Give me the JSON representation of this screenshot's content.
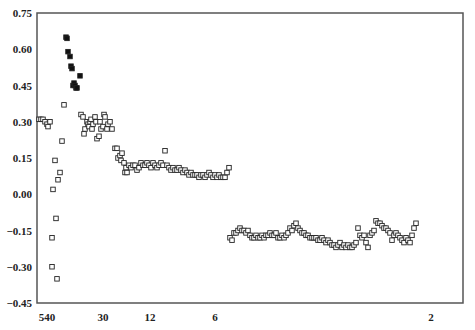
{
  "chart_data": {
    "type": "scatter",
    "title": "",
    "xlabel": "",
    "ylabel": "",
    "ylim": [
      -0.45,
      0.75
    ],
    "y_ticks": [
      "0.75",
      "0.60",
      "0.45",
      "0.30",
      "0.15",
      "0.00",
      "-0.15",
      "-0.30",
      "-0.45"
    ],
    "x_ticks": [
      {
        "label": "540",
        "px": 47
      },
      {
        "label": "30",
        "px": 103
      },
      {
        "label": "12",
        "px": 150
      },
      {
        "label": "6",
        "px": 215
      },
      {
        "label": "2",
        "px": 431
      }
    ],
    "grid": false,
    "legend": null,
    "series": [
      {
        "name": "filled",
        "marker": "filled-square",
        "points": [
          [
            66,
            0.65
          ],
          [
            67,
            0.645
          ],
          [
            68,
            0.59
          ],
          [
            70,
            0.57
          ],
          [
            71,
            0.53
          ],
          [
            72,
            0.52
          ],
          [
            73,
            0.45
          ],
          [
            74,
            0.46
          ],
          [
            75,
            0.45
          ],
          [
            76,
            0.44
          ],
          [
            77,
            0.44
          ],
          [
            80,
            0.49
          ]
        ]
      },
      {
        "name": "open",
        "marker": "open-square",
        "points": [
          [
            39,
            0.31
          ],
          [
            41,
            0.31
          ],
          [
            43,
            0.31
          ],
          [
            45,
            0.3
          ],
          [
            47,
            0.29
          ],
          [
            48,
            0.28
          ],
          [
            50,
            0.3
          ],
          [
            52,
            -0.18
          ],
          [
            52,
            -0.3
          ],
          [
            53,
            0.02
          ],
          [
            55,
            0.14
          ],
          [
            56,
            -0.1
          ],
          [
            57,
            -0.35
          ],
          [
            58,
            0.06
          ],
          [
            60,
            0.09
          ],
          [
            62,
            0.22
          ],
          [
            64,
            0.37
          ],
          [
            81,
            0.33
          ],
          [
            83,
            0.32
          ],
          [
            84,
            0.25
          ],
          [
            85,
            0.27
          ],
          [
            87,
            0.3
          ],
          [
            88,
            0.29
          ],
          [
            89,
            0.28
          ],
          [
            90,
            0.3
          ],
          [
            91,
            0.31
          ],
          [
            92,
            0.27
          ],
          [
            93,
            0.29
          ],
          [
            95,
            0.32
          ],
          [
            96,
            0.3
          ],
          [
            97,
            0.23
          ],
          [
            99,
            0.24
          ],
          [
            100,
            0.3
          ],
          [
            101,
            0.27
          ],
          [
            103,
            0.28
          ],
          [
            104,
            0.33
          ],
          [
            105,
            0.32
          ],
          [
            107,
            0.27
          ],
          [
            108,
            0.29
          ],
          [
            110,
            0.3
          ],
          [
            112,
            0.27
          ],
          [
            115,
            0.19
          ],
          [
            117,
            0.19
          ],
          [
            118,
            0.15
          ],
          [
            120,
            0.16
          ],
          [
            121,
            0.14
          ],
          [
            122,
            0.17
          ],
          [
            124,
            0.13
          ],
          [
            125,
            0.09
          ],
          [
            126,
            0.11
          ],
          [
            127,
            0.09
          ],
          [
            129,
            0.12
          ],
          [
            131,
            0.11
          ],
          [
            133,
            0.12
          ],
          [
            135,
            0.12
          ],
          [
            137,
            0.1
          ],
          [
            139,
            0.11
          ],
          [
            141,
            0.13
          ],
          [
            143,
            0.12
          ],
          [
            145,
            0.12
          ],
          [
            147,
            0.13
          ],
          [
            149,
            0.12
          ],
          [
            151,
            0.11
          ],
          [
            153,
            0.13
          ],
          [
            155,
            0.12
          ],
          [
            157,
            0.11
          ],
          [
            159,
            0.12
          ],
          [
            161,
            0.13
          ],
          [
            163,
            0.12
          ],
          [
            165,
            0.18
          ],
          [
            167,
            0.12
          ],
          [
            169,
            0.11
          ],
          [
            171,
            0.1
          ],
          [
            173,
            0.11
          ],
          [
            175,
            0.1
          ],
          [
            177,
            0.1
          ],
          [
            179,
            0.11
          ],
          [
            181,
            0.1
          ],
          [
            183,
            0.09
          ],
          [
            185,
            0.1
          ],
          [
            187,
            0.09
          ],
          [
            189,
            0.08
          ],
          [
            191,
            0.09
          ],
          [
            193,
            0.08
          ],
          [
            195,
            0.08
          ],
          [
            197,
            0.08
          ],
          [
            199,
            0.07
          ],
          [
            201,
            0.08
          ],
          [
            203,
            0.08
          ],
          [
            205,
            0.07
          ],
          [
            207,
            0.08
          ],
          [
            209,
            0.09
          ],
          [
            211,
            0.08
          ],
          [
            213,
            0.07
          ],
          [
            215,
            0.08
          ],
          [
            217,
            0.07
          ],
          [
            219,
            0.08
          ],
          [
            221,
            0.07
          ],
          [
            223,
            0.07
          ],
          [
            225,
            0.07
          ],
          [
            227,
            0.09
          ],
          [
            229,
            0.11
          ],
          [
            230,
            -0.18
          ],
          [
            232,
            -0.19
          ],
          [
            234,
            -0.16
          ],
          [
            236,
            -0.16
          ],
          [
            238,
            -0.15
          ],
          [
            240,
            -0.14
          ],
          [
            242,
            -0.15
          ],
          [
            244,
            -0.15
          ],
          [
            246,
            -0.16
          ],
          [
            248,
            -0.15
          ],
          [
            250,
            -0.17
          ],
          [
            252,
            -0.18
          ],
          [
            254,
            -0.18
          ],
          [
            256,
            -0.17
          ],
          [
            258,
            -0.18
          ],
          [
            260,
            -0.18
          ],
          [
            262,
            -0.17
          ],
          [
            264,
            -0.18
          ],
          [
            266,
            -0.17
          ],
          [
            268,
            -0.17
          ],
          [
            270,
            -0.16
          ],
          [
            272,
            -0.17
          ],
          [
            274,
            -0.17
          ],
          [
            276,
            -0.16
          ],
          [
            278,
            -0.18
          ],
          [
            280,
            -0.18
          ],
          [
            282,
            -0.17
          ],
          [
            284,
            -0.18
          ],
          [
            286,
            -0.17
          ],
          [
            288,
            -0.16
          ],
          [
            290,
            -0.14
          ],
          [
            292,
            -0.15
          ],
          [
            294,
            -0.13
          ],
          [
            296,
            -0.12
          ],
          [
            298,
            -0.14
          ],
          [
            300,
            -0.15
          ],
          [
            302,
            -0.16
          ],
          [
            304,
            -0.16
          ],
          [
            306,
            -0.17
          ],
          [
            308,
            -0.17
          ],
          [
            310,
            -0.18
          ],
          [
            312,
            -0.18
          ],
          [
            314,
            -0.18
          ],
          [
            316,
            -0.18
          ],
          [
            318,
            -0.19
          ],
          [
            320,
            -0.19
          ],
          [
            322,
            -0.18
          ],
          [
            324,
            -0.19
          ],
          [
            326,
            -0.2
          ],
          [
            328,
            -0.19
          ],
          [
            330,
            -0.2
          ],
          [
            332,
            -0.21
          ],
          [
            334,
            -0.21
          ],
          [
            336,
            -0.22
          ],
          [
            338,
            -0.21
          ],
          [
            340,
            -0.2
          ],
          [
            342,
            -0.22
          ],
          [
            344,
            -0.21
          ],
          [
            346,
            -0.22
          ],
          [
            348,
            -0.21
          ],
          [
            350,
            -0.22
          ],
          [
            352,
            -0.22
          ],
          [
            354,
            -0.21
          ],
          [
            356,
            -0.2
          ],
          [
            358,
            -0.14
          ],
          [
            360,
            -0.17
          ],
          [
            362,
            -0.18
          ],
          [
            364,
            -0.17
          ],
          [
            366,
            -0.2
          ],
          [
            368,
            -0.22
          ],
          [
            370,
            -0.17
          ],
          [
            372,
            -0.16
          ],
          [
            374,
            -0.15
          ],
          [
            376,
            -0.11
          ],
          [
            378,
            -0.12
          ],
          [
            380,
            -0.12
          ],
          [
            382,
            -0.13
          ],
          [
            384,
            -0.14
          ],
          [
            386,
            -0.14
          ],
          [
            388,
            -0.15
          ],
          [
            390,
            -0.16
          ],
          [
            392,
            -0.19
          ],
          [
            394,
            -0.17
          ],
          [
            396,
            -0.16
          ],
          [
            398,
            -0.17
          ],
          [
            400,
            -0.18
          ],
          [
            402,
            -0.19
          ],
          [
            404,
            -0.2
          ],
          [
            406,
            -0.18
          ],
          [
            408,
            -0.19
          ],
          [
            410,
            -0.2
          ],
          [
            412,
            -0.17
          ],
          [
            414,
            -0.14
          ],
          [
            416,
            -0.12
          ]
        ]
      }
    ],
    "plot_area_px": {
      "left": 37,
      "right": 463,
      "top": 13,
      "bottom": 303
    }
  }
}
